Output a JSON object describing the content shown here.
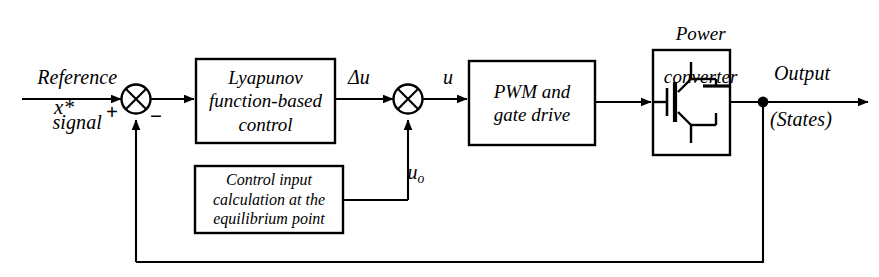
{
  "diagram": {
    "type": "control-block-diagram",
    "width": 879,
    "height": 277,
    "background_color": "#ffffff",
    "line_color": "#000000"
  },
  "labels": {
    "reference_line1": "Reference",
    "reference_line2": "signal",
    "reference_symbol": "x*",
    "plus_sign": "+",
    "minus_sign": "−",
    "delta_u": "Δu",
    "u": "u",
    "u_o_base": "u",
    "u_o_sub": "o",
    "power_converter_line1": "Power",
    "power_converter_line2": "converter",
    "output_line1": "Output",
    "output_line2": "(States)"
  },
  "blocks": [
    {
      "id": "lyapunov-control",
      "lines": [
        "Lyapunov",
        "function-based",
        "control"
      ]
    },
    {
      "id": "pwm-gate-drive",
      "lines": [
        "PWM and",
        "gate drive"
      ]
    },
    {
      "id": "power-converter",
      "lines": [],
      "symbol": "igbt-with-antiparallel-diode"
    },
    {
      "id": "control-input-calculation",
      "lines": [
        "Control input",
        "calculation at the",
        "equilibrium point"
      ]
    }
  ],
  "signals": [
    {
      "id": "reference-input",
      "label": "x*",
      "from": "external",
      "to": "summing-junction-1"
    },
    {
      "id": "error",
      "from": "summing-junction-1",
      "to": "lyapunov-control"
    },
    {
      "id": "delta-u",
      "label": "Δu",
      "from": "lyapunov-control",
      "to": "summing-junction-2"
    },
    {
      "id": "u-o",
      "label": "uo",
      "from": "control-input-calculation",
      "to": "summing-junction-2"
    },
    {
      "id": "u",
      "label": "u",
      "from": "summing-junction-2",
      "to": "pwm-gate-drive"
    },
    {
      "id": "gate-signal",
      "from": "pwm-gate-drive",
      "to": "power-converter"
    },
    {
      "id": "output-states",
      "label": "Output (States)",
      "from": "power-converter",
      "to": "external"
    },
    {
      "id": "feedback",
      "from": "output-node",
      "to": "summing-junction-1"
    }
  ]
}
